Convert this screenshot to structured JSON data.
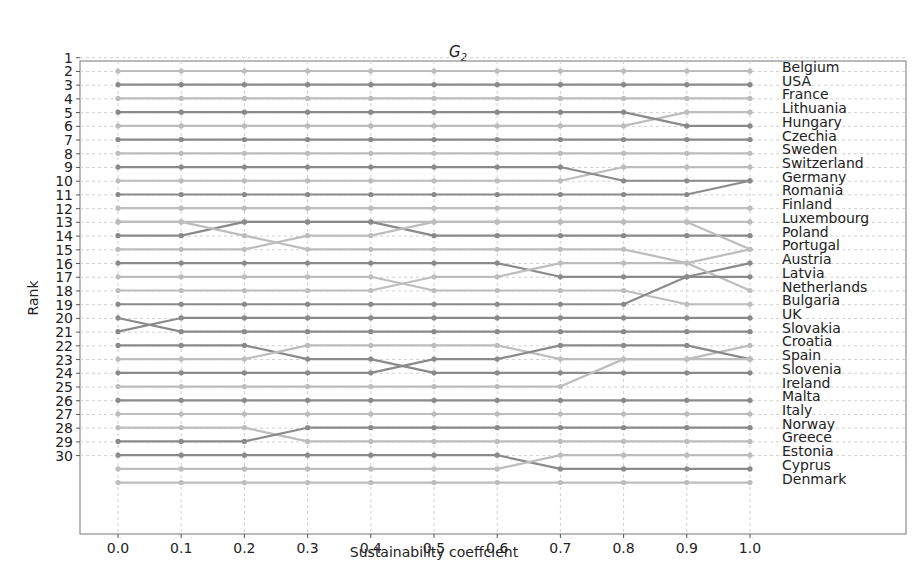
{
  "chart_data": {
    "type": "line",
    "title": "G",
    "title_subscript": "2",
    "xlabel": "Sustainability coeffcient",
    "ylabel": "Rank",
    "x": [
      0.0,
      0.1,
      0.2,
      0.3,
      0.4,
      0.5,
      0.6,
      0.7,
      0.8,
      0.9,
      1.0
    ],
    "x_tick_labels": [
      "0.0",
      "0.1",
      "0.2",
      "0.3",
      "0.4",
      "0.5",
      "0.6",
      "0.7",
      "0.8",
      "0.9",
      "1.0"
    ],
    "y_tick_labels": [
      "1",
      "2",
      "3",
      "4",
      "5",
      "6",
      "7",
      "8",
      "9",
      "10",
      "11",
      "12",
      "13",
      "14",
      "15",
      "16",
      "17",
      "18",
      "19",
      "20",
      "21",
      "22",
      "23",
      "24",
      "25",
      "26",
      "27",
      "28",
      "29",
      "30"
    ],
    "ylim": [
      0,
      32
    ],
    "xlim": [
      -0.07,
      1.35
    ],
    "grid": true,
    "legend_position": "right-side labels at final rank",
    "right_labels": [
      "Belgium",
      "USA",
      "France",
      "Lithuania",
      "Hungary",
      "Czechia",
      "Sweden",
      "Switzerland",
      "Germany",
      "Romania",
      "Finland",
      "Luxembourg",
      "Poland",
      "Portugal",
      "Austria",
      "Latvia",
      "Netherlands",
      "Bulgaria",
      "UK",
      "Slovakia",
      "Croatia",
      "Spain",
      "Slovenia",
      "Ireland",
      "Malta",
      "Italy",
      "Norway",
      "Greece",
      "Estonia",
      "Cyprus",
      "Denmark"
    ],
    "series": [
      {
        "name": "Belgium",
        "shade": "light",
        "values": [
          1,
          1,
          1,
          1,
          1,
          1,
          1,
          1,
          1,
          1,
          1
        ]
      },
      {
        "name": "USA",
        "shade": "dark",
        "values": [
          2,
          2,
          2,
          2,
          2,
          2,
          2,
          2,
          2,
          2,
          2
        ]
      },
      {
        "name": "France",
        "shade": "light",
        "values": [
          3,
          3,
          3,
          3,
          3,
          3,
          3,
          3,
          3,
          3,
          3
        ]
      },
      {
        "name": "Lithuania",
        "shade": "light",
        "values": [
          5,
          5,
          5,
          5,
          5,
          5,
          5,
          5,
          5,
          4,
          4
        ]
      },
      {
        "name": "Hungary",
        "shade": "dark",
        "values": [
          4,
          4,
          4,
          4,
          4,
          4,
          4,
          4,
          4,
          5,
          5
        ]
      },
      {
        "name": "Czechia",
        "shade": "dark",
        "values": [
          6,
          6,
          6,
          6,
          6,
          6,
          6,
          6,
          6,
          6,
          6
        ]
      },
      {
        "name": "Sweden",
        "shade": "light",
        "values": [
          7,
          7,
          7,
          7,
          7,
          7,
          7,
          7,
          7,
          7,
          7
        ]
      },
      {
        "name": "Switzerland",
        "shade": "light",
        "values": [
          9,
          9,
          9,
          9,
          9,
          9,
          9,
          9,
          8,
          8,
          8
        ]
      },
      {
        "name": "Germany",
        "shade": "dark",
        "values": [
          8,
          8,
          8,
          8,
          8,
          8,
          8,
          8,
          9,
          9,
          9
        ]
      },
      {
        "name": "Romania",
        "shade": "dark",
        "values": [
          10,
          10,
          10,
          10,
          10,
          10,
          10,
          10,
          10,
          10,
          9
        ]
      },
      {
        "name": "Finland",
        "shade": "light",
        "values": [
          11,
          11,
          11,
          11,
          11,
          11,
          11,
          11,
          11,
          11,
          11
        ]
      },
      {
        "name": "Luxembourg",
        "shade": "light",
        "values": [
          12,
          12,
          12,
          12,
          12,
          12,
          12,
          12,
          12,
          12,
          12
        ]
      },
      {
        "name": "Poland",
        "shade": "dark",
        "values": [
          13,
          13,
          12,
          12,
          12,
          13,
          13,
          13,
          13,
          13,
          13
        ]
      },
      {
        "name": "Portugal",
        "shade": "light",
        "values": [
          14,
          14,
          14,
          13,
          13,
          12,
          12,
          12,
          12,
          12,
          14
        ]
      },
      {
        "name": "Austria",
        "shade": "light",
        "values": [
          12,
          12,
          13,
          14,
          14,
          14,
          14,
          14,
          14,
          15,
          14
        ]
      },
      {
        "name": "Latvia",
        "shade": "dark",
        "values": [
          15,
          15,
          15,
          15,
          15,
          15,
          15,
          16,
          16,
          16,
          15
        ]
      },
      {
        "name": "Netherlands",
        "shade": "light",
        "values": [
          16,
          16,
          16,
          16,
          16,
          17,
          17,
          17,
          17,
          18,
          18
        ]
      },
      {
        "name": "Bulgaria",
        "shade": "light",
        "values": [
          17,
          17,
          17,
          17,
          17,
          16,
          16,
          15,
          15,
          15,
          17
        ]
      },
      {
        "name": "UK",
        "shade": "dark",
        "values": [
          18,
          18,
          18,
          18,
          18,
          18,
          18,
          18,
          18,
          16,
          16
        ]
      },
      {
        "name": "Slovakia",
        "shade": "dark",
        "values": [
          19,
          20,
          20,
          20,
          20,
          20,
          20,
          20,
          20,
          20,
          20
        ]
      },
      {
        "name": "Croatia",
        "shade": "dark",
        "values": [
          20,
          19,
          19,
          19,
          19,
          19,
          19,
          19,
          19,
          19,
          19
        ]
      },
      {
        "name": "Spain",
        "shade": "dark",
        "values": [
          21,
          21,
          21,
          22,
          22,
          23,
          23,
          23,
          23,
          23,
          23
        ]
      },
      {
        "name": "Slovenia",
        "shade": "light",
        "values": [
          22,
          22,
          22,
          21,
          21,
          21,
          21,
          22,
          22,
          22,
          21
        ]
      },
      {
        "name": "Ireland",
        "shade": "dark",
        "values": [
          23,
          23,
          23,
          23,
          23,
          22,
          22,
          21,
          21,
          21,
          22
        ]
      },
      {
        "name": "Malta",
        "shade": "light",
        "values": [
          24,
          24,
          24,
          24,
          24,
          24,
          24,
          24,
          22,
          22,
          22
        ]
      },
      {
        "name": "Italy",
        "shade": "dark",
        "values": [
          25,
          25,
          25,
          25,
          25,
          25,
          25,
          25,
          25,
          25,
          25
        ]
      },
      {
        "name": "Norway",
        "shade": "light",
        "values": [
          26,
          26,
          26,
          26,
          26,
          26,
          26,
          26,
          26,
          26,
          26
        ]
      },
      {
        "name": "Greece",
        "shade": "light",
        "values": [
          27,
          27,
          27,
          28,
          28,
          28,
          28,
          28,
          28,
          28,
          28
        ]
      },
      {
        "name": "Estonia",
        "shade": "dark",
        "values": [
          28,
          28,
          28,
          27,
          27,
          27,
          27,
          27,
          27,
          27,
          27
        ]
      },
      {
        "name": "Cyprus",
        "shade": "dark",
        "values": [
          29,
          29,
          29,
          29,
          29,
          29,
          29,
          30,
          30,
          30,
          30
        ]
      },
      {
        "name": "Denmark",
        "shade": "light",
        "values": [
          30,
          30,
          30,
          30,
          30,
          30,
          30,
          29,
          29,
          29,
          29
        ]
      },
      {
        "name": "Denmark-31",
        "shade": "light",
        "values": [
          31,
          31,
          31,
          31,
          31,
          31,
          31,
          31,
          31,
          31,
          31
        ]
      }
    ],
    "colors": {
      "dark": "#8a8a8a",
      "light": "#bdbdbd",
      "grid": "#d0d0d0",
      "axis": "#555555"
    }
  }
}
